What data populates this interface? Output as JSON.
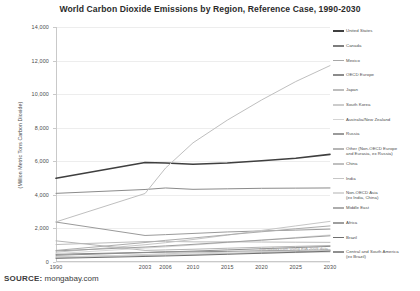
{
  "chart_data": {
    "type": "line",
    "title": "World Carbon Dioxide Emissions by Region, Reference Case, 1990-2030",
    "xlabel": "",
    "ylabel": "(Million Metric Tons Carbon Dioxide)",
    "xlim": [
      1990,
      2030
    ],
    "ylim": [
      0,
      14000
    ],
    "yticks": [
      0,
      2000,
      4000,
      6000,
      8000,
      10000,
      12000,
      14000
    ],
    "ytick_labels": [
      "0",
      "2,000",
      "4,000",
      "6,000",
      "8,000",
      "10,000",
      "12,000",
      "14,000"
    ],
    "xticks": [
      1990,
      2003,
      2006,
      2010,
      2015,
      2020,
      2025,
      2030
    ],
    "xtick_labels": [
      "1990",
      "2003",
      "2006",
      "2010",
      "2015",
      "2020",
      "2025",
      "2030"
    ],
    "grid": true,
    "legend_position": "right",
    "annotation": "mongabay.com using EIA 2009 data",
    "x": [
      1990,
      2003,
      2006,
      2010,
      2015,
      2020,
      2025,
      2030
    ],
    "series": [
      {
        "name": "United States",
        "color": "#3f3f3f",
        "values": [
          4990,
          5930,
          5900,
          5820,
          5900,
          6030,
          6180,
          6410
        ]
      },
      {
        "name": "Canada",
        "color": "#7d7d7d",
        "values": [
          460,
          570,
          600,
          600,
          630,
          660,
          690,
          710
        ]
      },
      {
        "name": "Mexico",
        "color": "#a8a8a8",
        "values": [
          300,
          390,
          420,
          450,
          500,
          560,
          620,
          680
        ]
      },
      {
        "name": "OECD Europe",
        "color": "#8b8b8b",
        "values": [
          4090,
          4320,
          4410,
          4330,
          4360,
          4390,
          4400,
          4410
        ]
      },
      {
        "name": "Japan",
        "color": "#bdbdbd",
        "values": [
          1040,
          1220,
          1230,
          1200,
          1200,
          1190,
          1180,
          1170
        ]
      },
      {
        "name": "South Korea",
        "color": "#cccccc",
        "values": [
          240,
          450,
          490,
          540,
          590,
          630,
          670,
          700
        ]
      },
      {
        "name": "Australia/New Zealand",
        "color": "#d4d4d4",
        "values": [
          300,
          420,
          440,
          460,
          500,
          530,
          560,
          590
        ]
      },
      {
        "name": "Russia",
        "color": "#9a9a9a",
        "values": [
          2380,
          1580,
          1630,
          1700,
          1790,
          1850,
          1900,
          1960
        ]
      },
      {
        "name": "Other (Non-OECD Europe\nand Eurasia, ex Russia)",
        "color": "#b5b5b5",
        "values": [
          1260,
          690,
          720,
          760,
          820,
          880,
          930,
          980
        ]
      },
      {
        "name": "China",
        "color": "#bfbfbf",
        "values": [
          2390,
          4080,
          5600,
          7100,
          8450,
          9650,
          10750,
          11700
        ]
      },
      {
        "name": "India",
        "color": "#c6c6c6",
        "values": [
          580,
          1030,
          1150,
          1340,
          1600,
          1880,
          2150,
          2420
        ]
      },
      {
        "name": "Non-OECD Asia\n(ex India, China)",
        "color": "#d8d8d8",
        "values": [
          500,
          830,
          900,
          1010,
          1160,
          1310,
          1460,
          1610
        ]
      },
      {
        "name": "Middle East",
        "color": "#adadad",
        "values": [
          690,
          1160,
          1290,
          1430,
          1620,
          1800,
          1980,
          2150
        ]
      },
      {
        "name": "Africa",
        "color": "#9e9e9e",
        "values": [
          660,
          890,
          960,
          1050,
          1180,
          1300,
          1430,
          1560
        ]
      },
      {
        "name": "Brazil",
        "color": "#6f6f6f",
        "values": [
          220,
          330,
          360,
          400,
          460,
          520,
          580,
          640
        ]
      },
      {
        "name": "Central and South America\n(ex Brazil)",
        "color": "#8f8f8f",
        "values": [
          400,
          560,
          600,
          650,
          720,
          790,
          860,
          930
        ]
      }
    ]
  },
  "source": {
    "label": "SOURCE:",
    "value": " mongabay.com"
  }
}
